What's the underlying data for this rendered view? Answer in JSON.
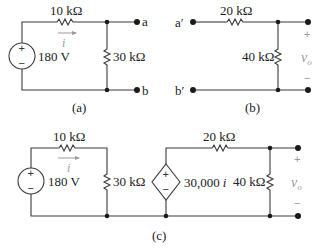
{
  "figure": {
    "panels": [
      {
        "id": "a",
        "caption": "(a)",
        "source": {
          "type": "independent-voltage",
          "value": "180 V",
          "plus": "+",
          "minus": "−"
        },
        "series_resistor": "10 kΩ",
        "current_label": "i",
        "shunt_resistor": "30 kΩ",
        "terminals": [
          "a",
          "b"
        ]
      },
      {
        "id": "b",
        "caption": "(b)",
        "terminals": [
          "a′",
          "b′"
        ],
        "series_resistor": "20 kΩ",
        "shunt_resistor": "40 kΩ",
        "output": {
          "label": "v",
          "subscript": "o",
          "plus": "+",
          "minus": "−"
        }
      },
      {
        "id": "c",
        "caption": "(c)",
        "source": {
          "type": "independent-voltage",
          "value": "180 V",
          "plus": "+",
          "minus": "−"
        },
        "series_resistor_1": "10 kΩ",
        "current_label": "i",
        "shunt_resistor_1": "30 kΩ",
        "dependent_source": {
          "type": "ccvs",
          "value": "30,000",
          "control": "i",
          "plus": "+",
          "minus": "−"
        },
        "series_resistor_2": "20 kΩ",
        "shunt_resistor_2": "40 kΩ",
        "output": {
          "label": "v",
          "subscript": "o",
          "plus": "+",
          "minus": "−"
        }
      }
    ]
  }
}
